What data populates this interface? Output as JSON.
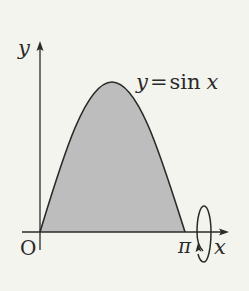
{
  "diagram": {
    "type": "function-plot-solid-of-revolution",
    "function_label": "y = sin x",
    "function_label_parts": {
      "y": "y",
      "eq": "=",
      "sin": "sin",
      "x": "x"
    },
    "axes": {
      "x_label": "x",
      "y_label": "y",
      "origin_label": "O",
      "x_end_label": "π"
    },
    "domain": [
      0,
      "π"
    ],
    "shaded_region": "area under y = sin x from 0 to π",
    "rotation_axis": "x",
    "colors": {
      "background": "#f4f4ee",
      "fill": "#bdbdbd",
      "stroke": "#2a2a2a"
    }
  }
}
